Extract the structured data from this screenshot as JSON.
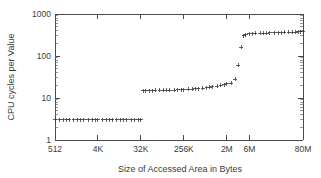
{
  "chart_data": {
    "type": "scatter",
    "title": "",
    "xlabel": "Size of Accessed Area in Bytes",
    "ylabel": "CPU cycles per Value",
    "xscale": "log",
    "yscale": "log",
    "grid": false,
    "legend": null,
    "xlim": [
      512,
      83886080
    ],
    "ylim": [
      1,
      1000
    ],
    "xtick_labels": [
      "512",
      "4K",
      "32K",
      "256K",
      "2M",
      "6M",
      "80M"
    ],
    "xtick_values": [
      512,
      4096,
      32768,
      262144,
      2097152,
      6291456,
      83886080
    ],
    "ytick_labels": [
      "1",
      "10",
      "100",
      "1000"
    ],
    "ytick_values": [
      1,
      10,
      100,
      1000
    ],
    "marker": "plus",
    "marker_color": "#3a3a3a",
    "series": [
      {
        "name": "CPU cycles per Value",
        "points": [
          [
            512,
            3.0
          ],
          [
            640,
            3.0
          ],
          [
            768,
            3.0
          ],
          [
            896,
            3.0
          ],
          [
            1024,
            3.0
          ],
          [
            1280,
            3.0
          ],
          [
            1536,
            3.0
          ],
          [
            1792,
            3.0
          ],
          [
            2048,
            3.0
          ],
          [
            2560,
            3.0
          ],
          [
            3072,
            3.0
          ],
          [
            3584,
            3.0
          ],
          [
            4096,
            3.0
          ],
          [
            5120,
            3.0
          ],
          [
            6144,
            3.0
          ],
          [
            7168,
            3.0
          ],
          [
            8192,
            3.0
          ],
          [
            10240,
            3.0
          ],
          [
            12288,
            3.0
          ],
          [
            14336,
            3.0
          ],
          [
            16384,
            3.0
          ],
          [
            20480,
            3.0
          ],
          [
            24576,
            3.0
          ],
          [
            28672,
            3.0
          ],
          [
            32768,
            3.0
          ],
          [
            36864,
            14.8
          ],
          [
            40960,
            14.9
          ],
          [
            49152,
            15.0
          ],
          [
            57344,
            15.0
          ],
          [
            65536,
            15.1
          ],
          [
            81920,
            15.2
          ],
          [
            98304,
            15.2
          ],
          [
            114688,
            15.3
          ],
          [
            131072,
            15.4
          ],
          [
            163840,
            15.5
          ],
          [
            196608,
            15.6
          ],
          [
            229376,
            15.7
          ],
          [
            262144,
            15.9
          ],
          [
            327680,
            16.1
          ],
          [
            393216,
            16.3
          ],
          [
            458752,
            16.5
          ],
          [
            524288,
            16.8
          ],
          [
            655360,
            17.2
          ],
          [
            786432,
            17.6
          ],
          [
            917504,
            18.0
          ],
          [
            1048576,
            18.6
          ],
          [
            1310720,
            19.3
          ],
          [
            1572864,
            20.0
          ],
          [
            1835008,
            20.8
          ],
          [
            2097152,
            21.6
          ],
          [
            2621440,
            22.4
          ],
          [
            3145728,
            28.0
          ],
          [
            3670016,
            60.0
          ],
          [
            4194304,
            160.0
          ],
          [
            4718592,
            300.0
          ],
          [
            5242880,
            320.0
          ],
          [
            6291456,
            335.0
          ],
          [
            7340032,
            340.0
          ],
          [
            8388608,
            345.0
          ],
          [
            10485760,
            348.0
          ],
          [
            12582912,
            350.0
          ],
          [
            14680064,
            352.0
          ],
          [
            16777216,
            355.0
          ],
          [
            20971520,
            358.0
          ],
          [
            25165824,
            360.0
          ],
          [
            29360128,
            362.0
          ],
          [
            33554432,
            365.0
          ],
          [
            41943040,
            368.0
          ],
          [
            50331648,
            370.0
          ],
          [
            58720256,
            372.0
          ],
          [
            67108864,
            375.0
          ],
          [
            75497472,
            378.0
          ],
          [
            83886080,
            380.0
          ]
        ]
      }
    ]
  }
}
